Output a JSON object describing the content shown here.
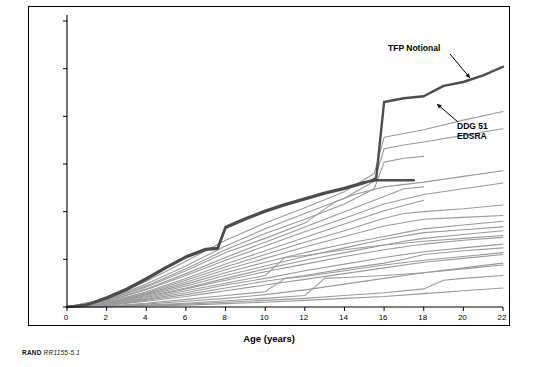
{
  "figure": {
    "credit_label": "RAND",
    "credit_number": "RR1155-5.1"
  },
  "annotations": [
    {
      "id": "tfp",
      "text": "TFP Notional"
    },
    {
      "id": "ddg",
      "text": "DDG 51\nEDSRA"
    }
  ],
  "chart_data": {
    "type": "line",
    "title": "",
    "xlabel": "Age (years)",
    "ylabel": "Man-Days",
    "xlim": [
      0,
      22
    ],
    "ylim": [
      0,
      300000
    ],
    "xticks": [
      0,
      2,
      4,
      6,
      8,
      10,
      12,
      14,
      16,
      18,
      20,
      22
    ],
    "yticks": [
      0,
      50000,
      100000,
      150000,
      200000,
      250000,
      300000
    ],
    "ytick_labels": [
      "0",
      "50,000",
      "100,000",
      "150,000",
      "200,000",
      "250,000",
      "300,000"
    ],
    "grid": false,
    "legend": "none",
    "colors": {
      "highlight": "#4d4d4d",
      "background_series": "#9a9a9a",
      "axis": "#000000"
    },
    "series": [
      {
        "name": "TFP Notional",
        "emphasis": "highlight",
        "x": [
          0,
          1,
          2,
          3,
          4,
          5,
          6,
          7,
          7.6,
          8,
          9,
          10,
          11,
          12,
          13,
          14,
          15,
          15.6,
          16,
          17,
          18,
          19,
          20,
          21,
          22
        ],
        "values": [
          0,
          2000,
          9000,
          18000,
          29000,
          41000,
          52000,
          60000,
          61000,
          83000,
          92000,
          100000,
          107000,
          113000,
          119000,
          124000,
          130000,
          135000,
          215000,
          219000,
          221000,
          232000,
          236000,
          243000,
          252000
        ]
      },
      {
        "name": "DDG 51 EDSRA",
        "emphasis": "highlight",
        "x": [
          0,
          1,
          2,
          3,
          4,
          5,
          6,
          7,
          7.6,
          8,
          9,
          10,
          11,
          12,
          13,
          14,
          15,
          15.6,
          16,
          17,
          17.5
        ],
        "values": [
          0,
          2500,
          10000,
          19000,
          30000,
          42000,
          53000,
          61000,
          62000,
          84000,
          93000,
          101000,
          108000,
          114000,
          120000,
          125000,
          131000,
          133000,
          133000,
          133000,
          133000
        ]
      },
      {
        "name": "ship-01",
        "emphasis": "background",
        "x": [
          0,
          2,
          4,
          6,
          8,
          10,
          12,
          14,
          15.5,
          16,
          18,
          20,
          22
        ],
        "values": [
          0,
          9000,
          27000,
          48000,
          70000,
          88000,
          104000,
          121000,
          140000,
          178000,
          186000,
          196000,
          205000
        ]
      },
      {
        "name": "ship-02",
        "emphasis": "background",
        "x": [
          0,
          2,
          4,
          6,
          8,
          10,
          12,
          14,
          15.5,
          16,
          17,
          18,
          20,
          22
        ],
        "values": [
          0,
          8000,
          24000,
          43000,
          64000,
          82000,
          98000,
          114000,
          132000,
          166000,
          170000,
          173000,
          180000,
          187000
        ]
      },
      {
        "name": "ship-03",
        "emphasis": "background",
        "x": [
          0,
          2,
          4,
          6,
          8,
          10,
          12,
          14,
          15.5,
          16,
          17,
          18
        ],
        "values": [
          0,
          7000,
          22000,
          40000,
          60000,
          77000,
          92000,
          108000,
          124000,
          152000,
          156000,
          158000
        ]
      },
      {
        "name": "ship-04",
        "emphasis": "background",
        "x": [
          0,
          2,
          4,
          6,
          8,
          10,
          12,
          13.5,
          14.5,
          16,
          18,
          20,
          22
        ],
        "values": [
          0,
          7000,
          21000,
          38000,
          57000,
          72000,
          88000,
          110000,
          118000,
          126000,
          131000,
          137000,
          143000
        ]
      },
      {
        "name": "ship-05",
        "emphasis": "background",
        "x": [
          0,
          2,
          4,
          6,
          8,
          10,
          12,
          14,
          16,
          17,
          18
        ],
        "values": [
          0,
          6000,
          19000,
          35000,
          52000,
          68000,
          84000,
          100000,
          116000,
          124000,
          126000
        ]
      },
      {
        "name": "ship-06",
        "emphasis": "background",
        "x": [
          0,
          2,
          4,
          6,
          8,
          10,
          12,
          14,
          16,
          18,
          20,
          22
        ],
        "values": [
          0,
          6000,
          18000,
          33000,
          49000,
          64000,
          79000,
          93000,
          108000,
          118000,
          124000,
          130000
        ]
      },
      {
        "name": "ship-07",
        "emphasis": "background",
        "x": [
          0,
          2,
          4,
          6,
          8,
          10,
          12,
          14,
          16,
          18
        ],
        "values": [
          0,
          5000,
          16000,
          30000,
          45000,
          59000,
          73000,
          87000,
          101000,
          112000
        ]
      },
      {
        "name": "ship-08",
        "emphasis": "background",
        "x": [
          0,
          2,
          4,
          6,
          8,
          10,
          12,
          14,
          16,
          17,
          18,
          20,
          22
        ],
        "values": [
          0,
          5000,
          15000,
          28000,
          42000,
          55000,
          68000,
          80000,
          93000,
          98000,
          100000,
          103000,
          107000
        ]
      },
      {
        "name": "ship-09",
        "emphasis": "background",
        "x": [
          0,
          2,
          4,
          6,
          8,
          10,
          12,
          14,
          16,
          18,
          20,
          22
        ],
        "values": [
          0,
          4000,
          14000,
          26000,
          39000,
          51000,
          63000,
          74000,
          85000,
          92000,
          94000,
          96000
        ]
      },
      {
        "name": "ship-10",
        "emphasis": "background",
        "x": [
          0,
          2,
          4,
          6,
          8,
          10,
          12,
          14,
          15,
          16,
          17,
          18,
          20,
          22
        ],
        "values": [
          0,
          4000,
          13000,
          24000,
          36000,
          47000,
          57000,
          66000,
          70000,
          74000,
          78000,
          82000,
          86000,
          90000
        ]
      },
      {
        "name": "ship-11",
        "emphasis": "background",
        "x": [
          0,
          2,
          4,
          6,
          8,
          10,
          12,
          14,
          16,
          18,
          20,
          22
        ],
        "values": [
          0,
          3500,
          12000,
          22000,
          33000,
          43000,
          53000,
          62000,
          71000,
          78000,
          81000,
          84000
        ]
      },
      {
        "name": "ship-12",
        "emphasis": "background",
        "x": [
          0,
          2,
          4,
          6,
          8,
          10,
          12,
          14,
          16,
          17,
          18,
          20,
          22
        ],
        "values": [
          0,
          3000,
          11000,
          20000,
          30000,
          40000,
          49000,
          57000,
          65000,
          69000,
          72000,
          76000,
          80000
        ]
      },
      {
        "name": "ship-13",
        "emphasis": "background",
        "x": [
          0,
          2,
          4,
          6,
          8,
          10,
          12,
          14,
          16,
          18,
          20,
          22
        ],
        "values": [
          0,
          3000,
          10000,
          19000,
          28000,
          37000,
          45000,
          53000,
          60000,
          66000,
          70000,
          73000
        ]
      },
      {
        "name": "ship-14",
        "emphasis": "background",
        "x": [
          0,
          2,
          4,
          6,
          8,
          10,
          11,
          12,
          14,
          16,
          18,
          20,
          22
        ],
        "values": [
          0,
          2500,
          9000,
          17000,
          25000,
          33000,
          52000,
          54000,
          60000,
          65000,
          69000,
          72000,
          75000
        ]
      },
      {
        "name": "ship-15",
        "emphasis": "background",
        "x": [
          0,
          2,
          4,
          6,
          8,
          10,
          12,
          14,
          16,
          18,
          20,
          22
        ],
        "values": [
          0,
          2000,
          8000,
          15000,
          23000,
          30000,
          38000,
          45000,
          52000,
          58000,
          62000,
          66000
        ]
      },
      {
        "name": "ship-16",
        "emphasis": "background",
        "x": [
          0,
          2,
          4,
          6,
          8,
          10,
          12,
          14,
          16,
          17,
          18,
          20,
          22
        ],
        "values": [
          0,
          2000,
          7000,
          13000,
          20000,
          27000,
          33000,
          40000,
          46000,
          50000,
          55000,
          59000,
          62000
        ]
      },
      {
        "name": "ship-17",
        "emphasis": "background",
        "x": [
          0,
          2,
          4,
          6,
          7,
          8,
          10,
          12,
          14,
          16,
          18,
          20,
          22
        ],
        "values": [
          0,
          1500,
          6000,
          11000,
          14000,
          17000,
          23000,
          29000,
          35000,
          41000,
          47000,
          51000,
          55000
        ]
      },
      {
        "name": "ship-18",
        "emphasis": "background",
        "x": [
          0,
          2,
          4,
          6,
          8,
          10,
          11,
          12,
          14,
          16,
          18,
          20,
          22
        ],
        "values": [
          0,
          1000,
          4000,
          8000,
          12000,
          16000,
          30000,
          32000,
          38000,
          44000,
          49000,
          53000,
          57000
        ]
      },
      {
        "name": "ship-19",
        "emphasis": "background",
        "x": [
          0,
          2,
          4,
          6,
          8,
          9,
          10,
          12,
          14,
          16,
          18,
          20,
          22
        ],
        "values": [
          0,
          800,
          3000,
          6000,
          9000,
          11000,
          13000,
          18000,
          24000,
          30000,
          36000,
          41000,
          46000
        ]
      },
      {
        "name": "ship-20",
        "emphasis": "background",
        "x": [
          0,
          2,
          4,
          6,
          8,
          10,
          12,
          13,
          14,
          16,
          18,
          20,
          22
        ],
        "values": [
          0,
          500,
          2000,
          4000,
          6500,
          9000,
          12000,
          30000,
          31000,
          33000,
          36000,
          40000,
          44000
        ]
      },
      {
        "name": "ship-21",
        "emphasis": "background",
        "x": [
          0,
          2,
          4,
          6,
          8,
          10,
          12,
          14,
          16,
          18,
          19,
          20,
          22
        ],
        "values": [
          0,
          400,
          1500,
          3000,
          5000,
          7000,
          9000,
          12000,
          15000,
          19000,
          28000,
          30000,
          33000
        ]
      },
      {
        "name": "ship-22",
        "emphasis": "background",
        "x": [
          0,
          2,
          4,
          6,
          8,
          10,
          12,
          14,
          16,
          18,
          20,
          22
        ],
        "values": [
          0,
          300,
          1000,
          2000,
          3500,
          5000,
          7000,
          9000,
          11000,
          14000,
          17000,
          20000
        ]
      }
    ]
  }
}
